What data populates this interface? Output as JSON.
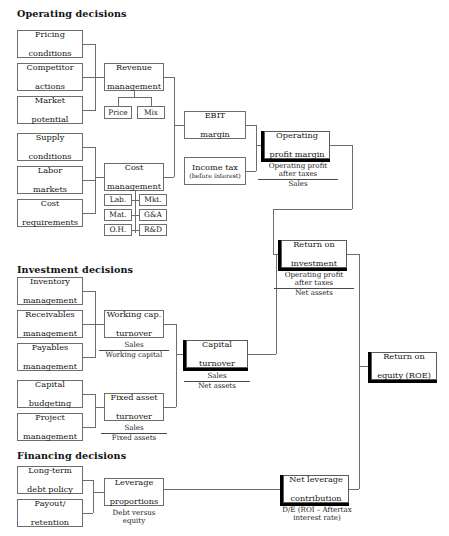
{
  "diagram": {
    "sections": [
      {
        "id": "operating",
        "label": "Operating decisions"
      },
      {
        "id": "investment",
        "label": "Investment decisions"
      },
      {
        "id": "financing",
        "label": "Financing decisions"
      }
    ],
    "nodes": {
      "pricing_conditions": {
        "line1": "Pricing",
        "line2": "conditions"
      },
      "competitor_actions": {
        "line1": "Competitor",
        "line2": "actions"
      },
      "market_potential": {
        "line1": "Market",
        "line2": "potential"
      },
      "supply_conditions": {
        "line1": "Supply",
        "line2": "conditions"
      },
      "labor_markets": {
        "line1": "Labor",
        "line2": "markets"
      },
      "cost_requirements": {
        "line1": "Cost",
        "line2": "requirements"
      },
      "revenue_management": {
        "line1": "Revenue",
        "line2": "management"
      },
      "cost_management": {
        "line1": "Cost",
        "line2": "management"
      },
      "price": {
        "line1": "Price"
      },
      "mix": {
        "line1": "Mix"
      },
      "lab": {
        "line1": "Lab."
      },
      "mkt": {
        "line1": "Mkt."
      },
      "mat": {
        "line1": "Mat."
      },
      "gna": {
        "line1": "G&A"
      },
      "oh": {
        "line1": "O.H."
      },
      "rnd": {
        "line1": "R&D"
      },
      "ebit_margin": {
        "line1": "EBIT",
        "line2": "margin"
      },
      "income_tax": {
        "line1": "Income tax",
        "line2": "(before interest)"
      },
      "operating_profit_margin": {
        "line1": "Operating",
        "line2": "profit margin"
      },
      "return_on_investment": {
        "line1": "Return on",
        "line2": "investment"
      },
      "return_on_equity": {
        "line1": "Return on",
        "line2": "equity (ROE)"
      },
      "inventory_management": {
        "line1": "Inventory",
        "line2": "management"
      },
      "receivables_management": {
        "line1": "Receivables",
        "line2": "management"
      },
      "payables_management": {
        "line1": "Payables",
        "line2": "management"
      },
      "capital_budgeting": {
        "line1": "Capital",
        "line2": "budgeting"
      },
      "project_management": {
        "line1": "Project",
        "line2": "management"
      },
      "working_capital_turnover": {
        "line1": "Working cap.",
        "line2": "turnover"
      },
      "fixed_asset_turnover": {
        "line1": "Fixed asset",
        "line2": "turnover"
      },
      "capital_turnover": {
        "line1": "Capital",
        "line2": "turnover"
      },
      "long_term_debt_policy": {
        "line1": "Long-term",
        "line2": "debt policy"
      },
      "payout_retention": {
        "line1": "Payout/",
        "line2": "retention"
      },
      "leverage_proportions": {
        "line1": "Leverage",
        "line2": "proportions"
      },
      "net_leverage_contribution": {
        "line1": "Net leverage",
        "line2": "contribution"
      }
    },
    "formulas": {
      "operating_profit_margin": {
        "numerator_line1": "Operating profit",
        "numerator_line2": "after taxes",
        "denominator": "Sales"
      },
      "return_on_investment": {
        "numerator_line1": "Operating profit",
        "numerator_line2": "after taxes",
        "denominator": "Net assets"
      },
      "working_capital_turnover": {
        "numerator_line1": "Sales",
        "denominator": "Working capital"
      },
      "fixed_asset_turnover": {
        "numerator_line1": "Sales",
        "denominator": "Fixed assets"
      },
      "capital_turnover": {
        "numerator_line1": "Sales",
        "denominator": "Net assets"
      },
      "leverage_proportions": {
        "line1": "Debt versus",
        "line2": "equity"
      },
      "net_leverage_contribution": {
        "line1": "D/E (ROI – Aftertax",
        "line2": "interest rate)"
      }
    },
    "colors": {
      "line": "#6d6d6d",
      "box_border": "#6d6d6d",
      "emphasis_shadow": "#000000",
      "text": "#161616",
      "background": "#ffffff"
    }
  }
}
